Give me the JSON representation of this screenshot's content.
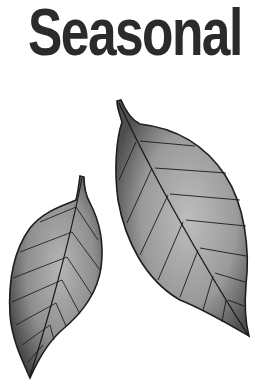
{
  "title": "Seasonal",
  "illustration": {
    "leaves": [
      {
        "name": "large-leaf",
        "fill_light": "#b8b8b8",
        "fill_dark": "#5a5a5a",
        "outline": "#1e1e1e"
      },
      {
        "name": "small-leaf",
        "fill_light": "#b0b0b0",
        "fill_dark": "#4a4a4a",
        "outline": "#1e1e1e"
      }
    ]
  },
  "colors": {
    "background": "#ffffff",
    "title_text": "#2b2b2b",
    "vein": "#1a1a1a"
  }
}
